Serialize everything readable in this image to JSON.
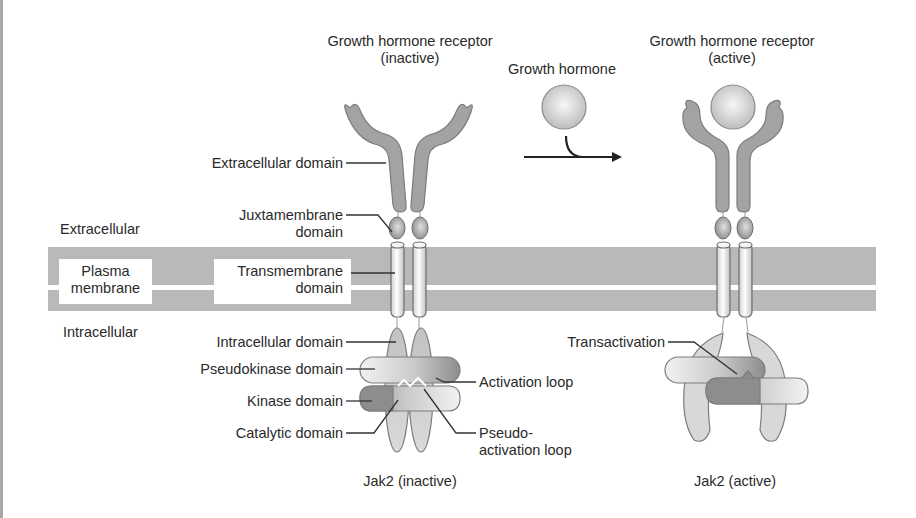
{
  "diagram": {
    "titles": {
      "receptor_inactive_line1": "Growth hormone receptor",
      "receptor_inactive_line2": "(inactive)",
      "receptor_active_line1": "Growth hormone receptor",
      "receptor_active_line2": "(active)",
      "growth_hormone": "Growth hormone",
      "jak2_inactive": "Jak2 (inactive)",
      "jak2_active": "Jak2 (active)"
    },
    "regions": {
      "extracellular": "Extracellular",
      "plasma_membrane_line1": "Plasma",
      "plasma_membrane_line2": "membrane",
      "intracellular": "Intracellular"
    },
    "receptor_labels": {
      "extracellular_domain": "Extracellular domain",
      "juxtamembrane_line1": "Juxtamembrane",
      "juxtamembrane_line2": "domain",
      "transmembrane_line1": "Transmembrane",
      "transmembrane_line2": "domain",
      "intracellular_domain": "Intracellular domain"
    },
    "jak2_labels": {
      "pseudokinase_domain": "Pseudokinase domain",
      "kinase_domain": "Kinase domain",
      "catalytic_domain": "Catalytic domain",
      "activation_loop": "Activation loop",
      "pseudo_activation_line1": "Pseudo-",
      "pseudo_activation_line2": "activation loop",
      "transactivation": "Transactivation"
    },
    "colors": {
      "membrane": "#b9b9b9",
      "receptor": "#a3a3a3",
      "receptor_stroke": "#7a7a7a",
      "hormone": "#d6d6d6",
      "kinase_dark": "#8c8c8c",
      "intracellular_domain": "#c8c8c8",
      "text": "#2a2a2a"
    }
  }
}
